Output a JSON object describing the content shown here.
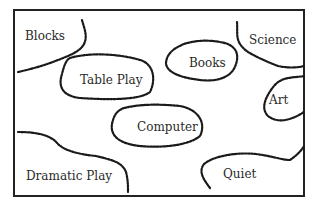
{
  "diagram": {
    "areas": [
      {
        "id": "blocks",
        "label": "Blocks"
      },
      {
        "id": "table-play",
        "label": "Table Play"
      },
      {
        "id": "books",
        "label": "Books"
      },
      {
        "id": "science",
        "label": "Science"
      },
      {
        "id": "art",
        "label": "Art"
      },
      {
        "id": "computer",
        "label": "Computer"
      },
      {
        "id": "dramatic-play",
        "label": "Dramatic Play"
      },
      {
        "id": "quiet",
        "label": "Quiet"
      }
    ],
    "colors": {
      "border": "#222222",
      "boundary": "#1a1a1a",
      "text": "#2a2a2a",
      "background": "#ffffff"
    }
  }
}
